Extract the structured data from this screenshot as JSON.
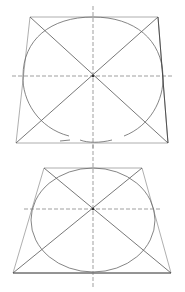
{
  "colors": {
    "background": "#ffffff",
    "stroke": "#555555",
    "light_stroke": "#9a9a9a",
    "dash": "#777777"
  },
  "figures": [
    {
      "name": "top-figure",
      "trapezoid": [
        [
          30,
          17
        ],
        [
          158,
          17
        ],
        [
          168,
          143
        ],
        [
          16,
          143
        ]
      ],
      "ellipse": {
        "cx": 93,
        "cy": 76,
        "rx": 70,
        "ry": 60
      },
      "center": [
        93,
        76
      ],
      "h_axis": {
        "x1": 12,
        "x2": 174,
        "y": 76
      },
      "v_axis": {
        "x": 93,
        "y1": 6,
        "y2": 150
      }
    },
    {
      "name": "bottom-figure",
      "trapezoid": [
        [
          44,
          168
        ],
        [
          142,
          168
        ],
        [
          171,
          273
        ],
        [
          13,
          273
        ]
      ],
      "ellipse": {
        "cx": 93,
        "cy": 210,
        "rx": 62,
        "ry": 52
      },
      "center": [
        93,
        209
      ],
      "h_axis": {
        "x1": 24,
        "x2": 162,
        "y": 209
      },
      "v_axis": {
        "x": 93,
        "y1": 145,
        "y2": 288
      }
    }
  ]
}
